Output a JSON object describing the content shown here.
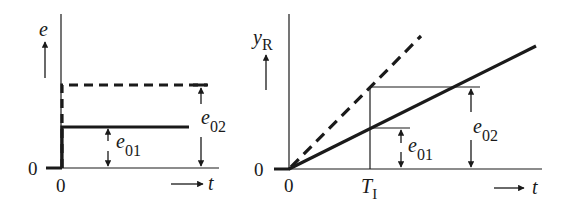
{
  "left_plot": {
    "y_label": "e",
    "x_label": "t",
    "origin_y_label": "0",
    "origin_x_label": "0",
    "annotations": {
      "e01": {
        "base": "e",
        "sub": "01"
      },
      "e02": {
        "base": "e",
        "sub": "02"
      }
    },
    "curves": [
      {
        "name": "step-e01",
        "style": "solid",
        "level": "e01"
      },
      {
        "name": "step-e02",
        "style": "dashed",
        "level": "e02"
      }
    ]
  },
  "right_plot": {
    "y_label": {
      "base": "y",
      "sub": "R"
    },
    "x_label": "t",
    "origin_y_label": "0",
    "origin_x_label": "0",
    "x_marker": {
      "base": "T",
      "sub": "I"
    },
    "annotations": {
      "e01": {
        "base": "e",
        "sub": "01"
      },
      "e02": {
        "base": "e",
        "sub": "02"
      }
    },
    "curves": [
      {
        "name": "ramp-e01",
        "style": "solid"
      },
      {
        "name": "ramp-e02",
        "style": "dashed"
      }
    ]
  },
  "colors": {
    "ink": "#1a1a1a",
    "background": "#ffffff"
  }
}
